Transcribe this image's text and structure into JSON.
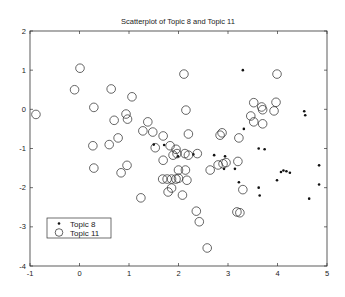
{
  "chart_data": {
    "type": "scatter",
    "title": "Scatterplot of Topic 8 and Topic 11",
    "xlabel": "",
    "ylabel": "",
    "xlim": [
      -1,
      5
    ],
    "ylim": [
      -4,
      2
    ],
    "xticks": [
      -1,
      0,
      1,
      2,
      3,
      4,
      5
    ],
    "yticks": [
      -4,
      -3,
      -2,
      -1,
      0,
      1,
      2
    ],
    "grid": false,
    "legend_position": "lower left",
    "series": [
      {
        "name": "Topic 8",
        "marker": "dot",
        "points": [
          [
            3.3,
            1.0
          ],
          [
            4.54,
            -0.05
          ],
          [
            4.56,
            -0.15
          ],
          [
            3.32,
            -0.5
          ],
          [
            3.62,
            -1.0
          ],
          [
            3.74,
            -1.02
          ],
          [
            2.94,
            -1.2
          ],
          [
            2.72,
            -1.17
          ],
          [
            1.71,
            -0.91
          ],
          [
            1.99,
            -1.2
          ],
          [
            2.92,
            -1.52
          ],
          [
            3.14,
            -1.52
          ],
          [
            4.07,
            -1.6
          ],
          [
            4.12,
            -1.56
          ],
          [
            4.18,
            -1.58
          ],
          [
            4.25,
            -1.62
          ],
          [
            3.99,
            -1.81
          ],
          [
            4.84,
            -1.43
          ],
          [
            4.84,
            -1.92
          ],
          [
            3.22,
            -1.86
          ],
          [
            3.62,
            -2.0
          ],
          [
            3.64,
            -2.2
          ],
          [
            4.64,
            -2.28
          ],
          [
            1.5,
            -0.9
          ],
          [
            2.3,
            -1.15
          ]
        ]
      },
      {
        "name": "Topic 11",
        "marker": "circle",
        "points": [
          [
            0.01,
            1.05
          ],
          [
            -0.1,
            0.5
          ],
          [
            0.64,
            0.52
          ],
          [
            1.06,
            0.32
          ],
          [
            2.11,
            0.9
          ],
          [
            -0.88,
            -0.13
          ],
          [
            0.29,
            0.05
          ],
          [
            0.7,
            -0.28
          ],
          [
            0.94,
            -0.12
          ],
          [
            0.97,
            -0.25
          ],
          [
            2.15,
            -0.02
          ],
          [
            1.38,
            -0.32
          ],
          [
            1.28,
            -0.55
          ],
          [
            1.48,
            -0.58
          ],
          [
            1.69,
            -0.68
          ],
          [
            2.2,
            -0.63
          ],
          [
            0.27,
            -0.93
          ],
          [
            0.6,
            -0.9
          ],
          [
            0.78,
            -0.73
          ],
          [
            0.29,
            -1.5
          ],
          [
            0.84,
            -1.62
          ],
          [
            0.96,
            -1.43
          ],
          [
            1.53,
            -0.98
          ],
          [
            1.83,
            -0.93
          ],
          [
            1.95,
            -1.02
          ],
          [
            1.89,
            -1.17
          ],
          [
            2.2,
            -1.17
          ],
          [
            1.69,
            -1.3
          ],
          [
            1.97,
            -1.13
          ],
          [
            2.13,
            -1.13
          ],
          [
            2.38,
            -1.13
          ],
          [
            2.84,
            -0.66
          ],
          [
            2.64,
            -1.55
          ],
          [
            2.8,
            -1.42
          ],
          [
            2.9,
            -1.39
          ],
          [
            1.68,
            -1.78
          ],
          [
            1.77,
            -1.78
          ],
          [
            1.86,
            -1.78
          ],
          [
            1.95,
            -1.78
          ],
          [
            2.0,
            -1.76
          ],
          [
            2.17,
            -1.81
          ],
          [
            2.0,
            -1.55
          ],
          [
            2.14,
            -1.55
          ],
          [
            1.86,
            -2.01
          ],
          [
            1.79,
            -2.11
          ],
          [
            2.08,
            -2.19
          ],
          [
            1.24,
            -2.26
          ],
          [
            2.36,
            -2.6
          ],
          [
            2.42,
            -2.87
          ],
          [
            2.58,
            -3.54
          ],
          [
            3.99,
            0.9
          ],
          [
            3.52,
            0.17
          ],
          [
            3.68,
            0.06
          ],
          [
            3.7,
            -0.01
          ],
          [
            3.97,
            0.18
          ],
          [
            3.93,
            -0.04
          ],
          [
            3.46,
            -0.17
          ],
          [
            3.52,
            -0.32
          ],
          [
            3.7,
            -0.37
          ],
          [
            2.88,
            -0.6
          ],
          [
            3.22,
            -0.73
          ],
          [
            2.96,
            -1.36
          ],
          [
            3.2,
            -1.33
          ],
          [
            3.3,
            -2.05
          ],
          [
            3.18,
            -2.62
          ],
          [
            3.24,
            -2.64
          ]
        ]
      }
    ]
  },
  "legend": {
    "items": [
      "Topic 8",
      "Topic 11"
    ]
  }
}
